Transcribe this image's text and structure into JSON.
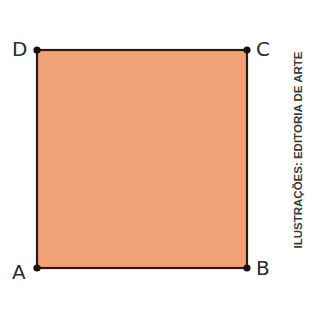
{
  "diagram": {
    "shape": "square",
    "fill_color": "#F0A276",
    "stroke_color": "#2a1a14",
    "vertices": [
      {
        "label": "A",
        "x": 37,
        "y": 268
      },
      {
        "label": "B",
        "x": 247,
        "y": 268
      },
      {
        "label": "C",
        "x": 247,
        "y": 50
      },
      {
        "label": "D",
        "x": 37,
        "y": 50
      }
    ]
  },
  "labels": {
    "A": "A",
    "B": "B",
    "C": "C",
    "D": "D"
  },
  "credit": "ILUSTRAÇÕES: EDITORIA DE ARTE"
}
